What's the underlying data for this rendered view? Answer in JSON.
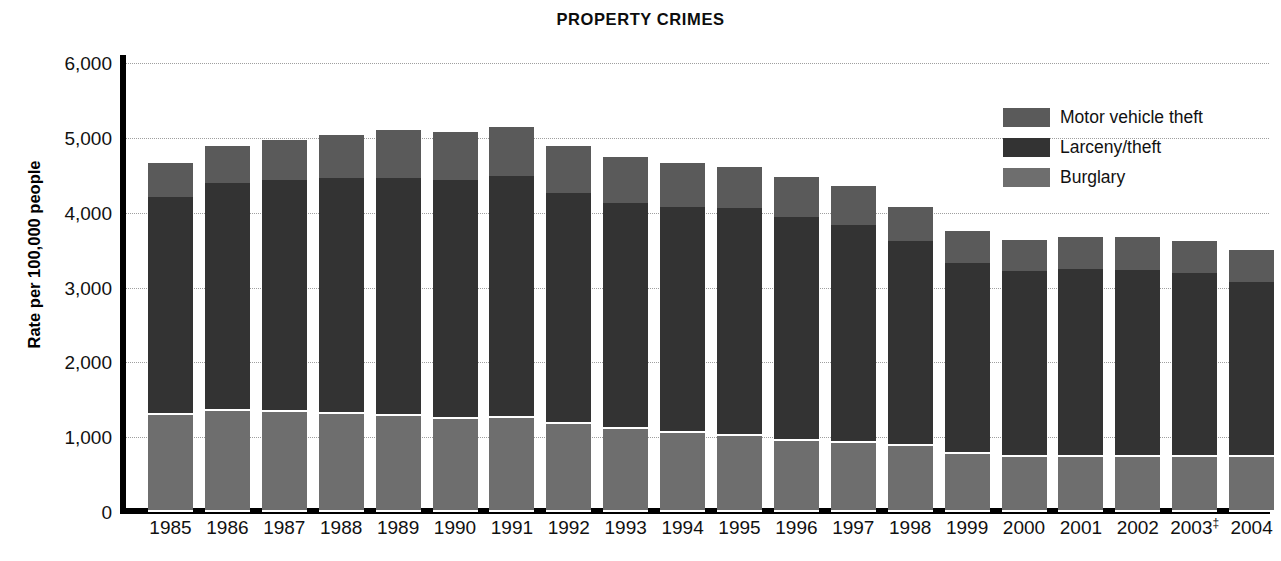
{
  "chart_data": {
    "type": "bar",
    "subtype": "stacked-bar",
    "title": "PROPERTY CRIMES",
    "xlabel": "",
    "ylabel": "Rate per 100,000 people",
    "ylim": [
      0,
      6000
    ],
    "ytick_values": [
      6000,
      5000,
      4000,
      3000,
      2000,
      1000,
      0
    ],
    "ytick_labels": [
      "6,000",
      "5,000",
      "4,000",
      "3,000",
      "2,000",
      "1,000",
      "0"
    ],
    "grid": true,
    "grid_axis": "y",
    "legend_position": "top-right",
    "categories": [
      "1985",
      "1986",
      "1987",
      "1988",
      "1989",
      "1990",
      "1991",
      "1992",
      "1993",
      "1994",
      "1995",
      "1996",
      "1997",
      "1998",
      "1999",
      "2000",
      "2001",
      "2002",
      "2003‡",
      "2004"
    ],
    "series": [
      {
        "name": "Burglary",
        "color": "#6e6e6e",
        "stack_order": 1,
        "values": [
          1290,
          1350,
          1340,
          1310,
          1280,
          1240,
          1260,
          1180,
          1110,
          1050,
          1010,
          950,
          920,
          880,
          770,
          730,
          740,
          740,
          740,
          730
        ]
      },
      {
        "name": "Larceny/theft",
        "color": "#333333",
        "stack_order": 2,
        "values": [
          2920,
          3040,
          3100,
          3150,
          3180,
          3190,
          3230,
          3080,
          3020,
          3020,
          3050,
          2990,
          2920,
          2740,
          2560,
          2490,
          2510,
          2500,
          2450,
          2350
        ]
      },
      {
        "name": "Motor vehicle theft",
        "color": "#5a5a5a",
        "stack_order": 3,
        "values": [
          460,
          500,
          530,
          580,
          650,
          650,
          660,
          630,
          610,
          590,
          550,
          540,
          510,
          460,
          420,
          410,
          430,
          430,
          430,
          420
        ]
      }
    ],
    "totals": [
      4670,
      4890,
      4970,
      5040,
      5110,
      5080,
      5150,
      4890,
      4740,
      4660,
      4610,
      4480,
      4350,
      4080,
      3750,
      3630,
      3680,
      3670,
      3620,
      3500
    ],
    "footnote_marker": "‡"
  },
  "legend": {
    "items": [
      {
        "label": "Motor vehicle theft",
        "color": "#5a5a5a"
      },
      {
        "label": "Larceny/theft",
        "color": "#333333"
      },
      {
        "label": "Burglary",
        "color": "#6e6e6e"
      }
    ]
  }
}
